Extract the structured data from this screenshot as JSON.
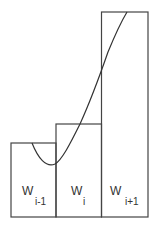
{
  "diagram": {
    "bins": [
      {
        "label": "W",
        "subscript": "i-1"
      },
      {
        "label": "W",
        "subscript": "i"
      },
      {
        "label": "W",
        "subscript": "i+1"
      }
    ],
    "colors": {
      "stroke": "#444444",
      "text": "#333333",
      "background": "#ffffff"
    }
  }
}
